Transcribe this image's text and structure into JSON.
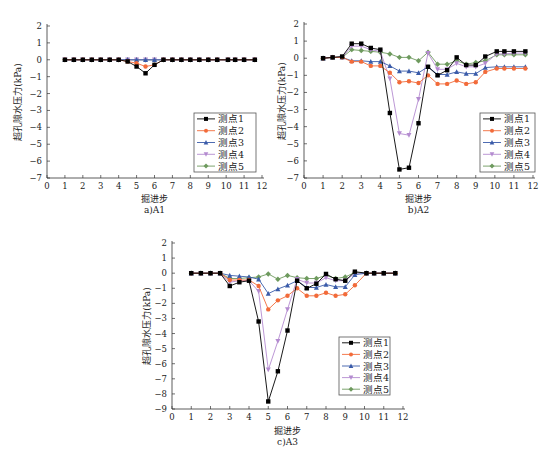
{
  "x": [
    1,
    1.5,
    2,
    2.5,
    3,
    3.5,
    4,
    4.5,
    5,
    5.5,
    6,
    6.5,
    7,
    7.5,
    8,
    8.5,
    9,
    9.5,
    10.1,
    10.5,
    11,
    11.6
  ],
  "chart_data": [
    {
      "id": "A1",
      "type": "line",
      "caption": "a)A1",
      "title": "",
      "xlabel": "掘进步",
      "ylabel": "超孔隙水压力(kPa)",
      "xlim": [
        0,
        12
      ],
      "ylim": [
        -7,
        2
      ],
      "xticks": [
        0,
        1,
        2,
        3,
        4,
        5,
        6,
        7,
        8,
        9,
        10,
        11,
        12
      ],
      "yticks": [
        2,
        1,
        0,
        -1,
        -2,
        -3,
        -4,
        -5,
        -6,
        -7
      ],
      "grid": false,
      "legend_position": "lower right",
      "x": [
        1,
        1.5,
        2,
        2.5,
        3,
        3.5,
        4,
        4.5,
        5,
        5.5,
        6,
        6.5,
        7,
        7.5,
        8,
        8.5,
        9,
        9.5,
        10.1,
        10.5,
        11,
        11.6
      ],
      "series": [
        {
          "name": "测点1",
          "color": "#000000",
          "marker": "square",
          "values": [
            0,
            0,
            0,
            0,
            0,
            0,
            0,
            -0.1,
            -0.4,
            -0.8,
            -0.3,
            0,
            0,
            0,
            0,
            0,
            0,
            0,
            0,
            0,
            0,
            0
          ]
        },
        {
          "name": "测点2",
          "color": "#F26B3A",
          "marker": "circle",
          "values": [
            0,
            0,
            0,
            0,
            0,
            0,
            0,
            -0.1,
            -0.2,
            -0.4,
            -0.3,
            0,
            0,
            0,
            0,
            0,
            0,
            0,
            0,
            0,
            0,
            0
          ]
        },
        {
          "name": "测点3",
          "color": "#3A5BA9",
          "marker": "triangle-up",
          "values": [
            0,
            0,
            0,
            0,
            0,
            0,
            0,
            0,
            0,
            0,
            0,
            0,
            0,
            0,
            0,
            0,
            0,
            0,
            0,
            0,
            0,
            0
          ]
        },
        {
          "name": "测点4",
          "color": "#B48BD0",
          "marker": "triangle-down",
          "values": [
            0,
            0,
            0,
            0,
            0,
            0,
            0,
            0,
            0,
            0,
            0,
            0,
            0,
            0,
            0,
            0,
            0,
            0,
            0,
            0,
            0,
            0
          ]
        },
        {
          "name": "测点5",
          "color": "#6E9A5E",
          "marker": "diamond",
          "values": [
            0,
            0,
            0,
            0,
            0,
            0,
            0,
            0,
            0,
            0,
            0,
            0,
            0,
            0,
            0,
            0,
            0,
            0,
            0,
            0,
            0,
            0
          ]
        }
      ]
    },
    {
      "id": "A2",
      "type": "line",
      "caption": "b)A2",
      "title": "",
      "xlabel": "掘进步",
      "ylabel": "超孔隙水压力(kPa)",
      "xlim": [
        0,
        12
      ],
      "ylim": [
        -7,
        2
      ],
      "xticks": [
        0,
        1,
        2,
        3,
        4,
        5,
        6,
        7,
        8,
        9,
        10,
        11,
        12
      ],
      "yticks": [
        2,
        1,
        0,
        -1,
        -2,
        -3,
        -4,
        -5,
        -6,
        -7
      ],
      "grid": false,
      "legend_position": "lower right",
      "x": [
        1,
        1.5,
        2,
        2.5,
        3,
        3.5,
        4,
        4.5,
        5,
        5.5,
        6,
        6.5,
        7,
        7.5,
        8,
        8.5,
        9,
        9.5,
        10.1,
        10.5,
        11,
        11.6
      ],
      "series": [
        {
          "name": "测点1",
          "color": "#000000",
          "marker": "square",
          "values": [
            0,
            0.05,
            0.1,
            0.85,
            0.85,
            0.6,
            0.5,
            -3.2,
            -6.5,
            -6.4,
            -3.8,
            -0.5,
            -1.0,
            -0.7,
            0.05,
            -0.4,
            -0.4,
            0.1,
            0.4,
            0.4,
            0.4,
            0.4
          ]
        },
        {
          "name": "测点2",
          "color": "#F26B3A",
          "marker": "circle",
          "values": [
            0,
            0.05,
            0.05,
            -0.2,
            -0.2,
            -0.45,
            -0.45,
            -0.85,
            -1.4,
            -1.35,
            -1.45,
            -1.0,
            -1.5,
            -1.5,
            -1.3,
            -1.5,
            -1.4,
            -0.8,
            -0.6,
            -0.6,
            -0.6,
            -0.6
          ]
        },
        {
          "name": "测点3",
          "color": "#3A5BA9",
          "marker": "triangle-up",
          "values": [
            0,
            0.05,
            0.05,
            -0.15,
            -0.15,
            -0.2,
            -0.2,
            -0.45,
            -0.75,
            -0.75,
            -0.85,
            -0.5,
            -0.95,
            -0.95,
            -0.8,
            -0.9,
            -0.9,
            -0.55,
            -0.5,
            -0.5,
            -0.5,
            -0.5
          ]
        },
        {
          "name": "测点4",
          "color": "#B48BD0",
          "marker": "triangle-down",
          "values": [
            0,
            0.05,
            0.05,
            0.7,
            0.7,
            0.5,
            0.4,
            -1.2,
            -4.4,
            -4.5,
            -2.4,
            0.3,
            -0.65,
            -0.65,
            -0.3,
            -0.5,
            -0.5,
            -0.3,
            0.25,
            0.25,
            0.3,
            0.3
          ]
        },
        {
          "name": "测点5",
          "color": "#6E9A5E",
          "marker": "diamond",
          "values": [
            0,
            0.05,
            0.05,
            0.5,
            0.45,
            0.4,
            0.35,
            0.25,
            0.05,
            0.05,
            -0.15,
            0.35,
            -0.35,
            -0.35,
            -0.15,
            -0.35,
            -0.25,
            -0.15,
            0.2,
            0.2,
            0.2,
            0.2
          ]
        }
      ]
    },
    {
      "id": "A3",
      "type": "line",
      "caption": "c)A3",
      "title": "",
      "xlabel": "掘进步",
      "ylabel": "超孔隙水压力(kPa)",
      "xlim": [
        0,
        12
      ],
      "ylim": [
        -9,
        2
      ],
      "xticks": [
        0,
        1,
        2,
        3,
        4,
        5,
        6,
        7,
        8,
        9,
        10,
        11,
        12
      ],
      "yticks": [
        2,
        1,
        0,
        -1,
        -2,
        -3,
        -4,
        -5,
        -6,
        -7,
        -8,
        -9
      ],
      "grid": false,
      "legend_position": "lower right",
      "x": [
        1,
        1.5,
        2,
        2.5,
        3,
        3.5,
        4,
        4.5,
        5,
        5.5,
        6,
        6.5,
        7,
        7.5,
        8,
        8.5,
        9,
        9.5,
        10.1,
        10.5,
        11,
        11.6
      ],
      "series": [
        {
          "name": "测点1",
          "color": "#000000",
          "marker": "square",
          "values": [
            0,
            0,
            0,
            0,
            -0.85,
            -0.6,
            -0.5,
            -3.2,
            -8.5,
            -6.5,
            -3.8,
            -0.5,
            -1.0,
            -0.7,
            -0.05,
            -0.4,
            -0.5,
            0.1,
            0,
            0,
            0,
            0
          ]
        },
        {
          "name": "测点2",
          "color": "#F26B3A",
          "marker": "circle",
          "values": [
            0,
            0,
            0,
            0,
            -0.45,
            -0.45,
            -0.45,
            -0.85,
            -2.4,
            -1.8,
            -1.5,
            -1.0,
            -1.5,
            -1.5,
            -1.3,
            -1.5,
            -1.4,
            -0.8,
            0,
            0,
            0,
            0
          ]
        },
        {
          "name": "测点3",
          "color": "#3A5BA9",
          "marker": "triangle-up",
          "values": [
            0,
            0,
            0,
            0,
            -0.15,
            -0.2,
            -0.25,
            -0.4,
            -1.35,
            -1.05,
            -0.8,
            -0.5,
            -0.95,
            -0.95,
            -0.75,
            -0.9,
            -0.9,
            -0.1,
            0,
            0,
            0,
            0
          ]
        },
        {
          "name": "测点4",
          "color": "#B48BD0",
          "marker": "triangle-down",
          "values": [
            0,
            0,
            0,
            0,
            -0.6,
            -0.5,
            -0.5,
            -1.2,
            -6.4,
            -4.5,
            -2.4,
            -0.4,
            -0.65,
            -0.65,
            -0.3,
            -0.5,
            -0.5,
            0,
            0,
            0,
            0,
            0
          ]
        },
        {
          "name": "测点5",
          "color": "#6E9A5E",
          "marker": "diamond",
          "values": [
            0,
            0,
            0,
            0,
            -0.35,
            -0.35,
            -0.3,
            -0.25,
            -0.05,
            -0.4,
            -0.15,
            -0.3,
            -0.35,
            -0.35,
            -0.15,
            -0.35,
            -0.25,
            0.05,
            0,
            0,
            0,
            0
          ]
        }
      ]
    }
  ],
  "layout": {
    "A1": {
      "left": 47,
      "right": 262,
      "top": 26,
      "bottom": 178,
      "legend": {
        "x": 194,
        "y": 113,
        "w": 62,
        "h": 59
      },
      "caption_y": 214,
      "xlabel_y": 202,
      "ylabel_x": 21
    },
    "A2": {
      "left": 304,
      "right": 533,
      "top": 24,
      "bottom": 178,
      "legend": {
        "x": 480,
        "y": 113,
        "w": 55,
        "h": 59
      },
      "caption_y": 214,
      "xlabel_y": 202,
      "ylabel_x": 285
    },
    "A3": {
      "left": 172,
      "right": 403,
      "top": 243,
      "bottom": 409,
      "legend": {
        "x": 339,
        "y": 337,
        "w": 51,
        "h": 58
      },
      "caption_y": 446,
      "xlabel_y": 434,
      "ylabel_x": 150
    }
  }
}
